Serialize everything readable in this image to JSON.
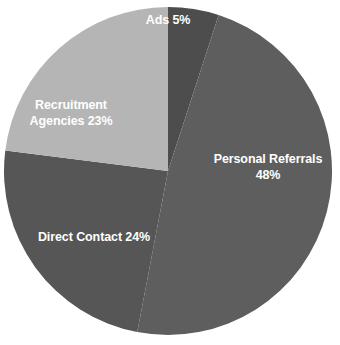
{
  "chart_data": {
    "type": "pie",
    "title": "",
    "subtitle": "",
    "xlabel": "",
    "ylabel": "",
    "legend": "none",
    "grid": false,
    "background_color": "#ffffff",
    "label_color": "#ffffff",
    "label_position": "inside",
    "start_angle_deg": 0,
    "direction": "clockwise",
    "center": {
      "x": 168,
      "y": 171
    },
    "radius": 164,
    "categories": [
      "Ads",
      "Personal Referrals",
      "Direct Contact",
      "Recruitment Agencies"
    ],
    "values": [
      5,
      48,
      24,
      23
    ],
    "unit": "%",
    "slices": [
      {
        "name": "Ads",
        "value": 5,
        "label_text": "Ads 5%",
        "label_lines": [
          "Ads 5%"
        ],
        "color": "#4d4d4d",
        "start_angle_deg": 0,
        "end_angle_deg": 18
      },
      {
        "name": "Personal Referrals",
        "value": 48,
        "label_text": "Personal Referrals 48%",
        "label_lines": [
          "Personal Referrals",
          "48%"
        ],
        "color": "#5e5e5e",
        "start_angle_deg": 18,
        "end_angle_deg": 190.8
      },
      {
        "name": "Direct Contact",
        "value": 24,
        "label_text": "Direct Contact 24%",
        "label_lines": [
          "Direct Contact 24%"
        ],
        "color": "#565656",
        "start_angle_deg": 190.8,
        "end_angle_deg": 277.2
      },
      {
        "name": "Recruitment Agencies",
        "value": 23,
        "label_text": "Recruitment Agencies 23%",
        "label_lines": [
          "Recruitment",
          "Agencies 23%"
        ],
        "color": "#b5b5b5",
        "start_angle_deg": 277.2,
        "end_angle_deg": 360
      }
    ]
  }
}
